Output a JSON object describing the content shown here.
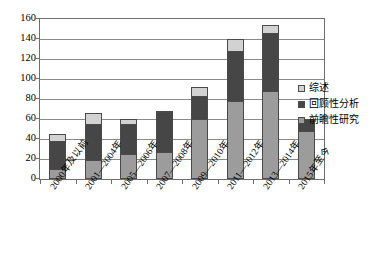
{
  "chart_data": {
    "type": "bar",
    "subtype": "stacked-vertical",
    "title": "",
    "xlabel": "",
    "ylabel": "",
    "ylim": [
      0,
      160
    ],
    "ytick_step": 20,
    "yticks": [
      0,
      20,
      40,
      60,
      80,
      100,
      120,
      140,
      160
    ],
    "grid": true,
    "grid_axis": "y",
    "legend_position": "right",
    "categories": [
      "2000年及以前",
      "2001—2004年",
      "2005—2006年",
      "2007—2008年",
      "2009—2010年",
      "2011—2012年",
      "2013—2014年",
      "2015年至今"
    ],
    "series": [
      {
        "name": "前瞻性研究",
        "color": "#9c9c9c",
        "values": [
          10,
          19,
          25,
          27,
          60,
          78,
          88,
          48
        ]
      },
      {
        "name": "回顾性分析",
        "color": "#464646",
        "values": [
          28,
          36,
          30,
          40,
          23,
          50,
          58,
          12
        ]
      },
      {
        "name": "综述",
        "color": "#d2d2d2",
        "values": [
          7,
          11,
          5,
          1,
          9,
          12,
          8,
          0
        ]
      }
    ],
    "totals": [
      45,
      66,
      60,
      68,
      92,
      140,
      154,
      60
    ]
  },
  "legend": {
    "items": [
      {
        "label": "综述",
        "swatch": "#d2d2d2"
      },
      {
        "label": "回顾性分析",
        "swatch": "#464646"
      },
      {
        "label": "前瞻性研究",
        "swatch": "#9c9c9c"
      }
    ]
  },
  "colors": {
    "axis": "#6e6e6e",
    "grid": "#8a8a8a",
    "bar_outline": "#4a4a4a",
    "background": "#ffffff",
    "text": "#000000"
  }
}
